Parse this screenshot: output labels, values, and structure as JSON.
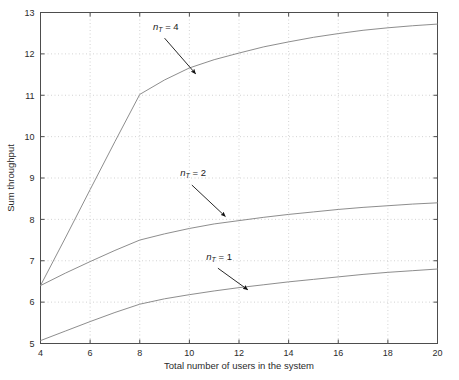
{
  "chart_data": {
    "type": "line",
    "title": "",
    "xlabel": "Total number of users in the system",
    "ylabel": "Sum throughput",
    "xlim": [
      4,
      20
    ],
    "ylim": [
      5,
      13
    ],
    "xticks": [
      4,
      6,
      8,
      10,
      12,
      14,
      16,
      18,
      20
    ],
    "yticks": [
      5,
      6,
      7,
      8,
      9,
      10,
      11,
      12,
      13
    ],
    "xtick_labels": [
      "4",
      "6",
      "8",
      "10",
      "12",
      "14",
      "16",
      "18",
      "20"
    ],
    "ytick_labels": [
      "5",
      "6",
      "7",
      "8",
      "9",
      "10",
      "11",
      "12",
      "13"
    ],
    "grid": true,
    "grid_style": "dotted",
    "grid_color": "#c8c8c8",
    "line_color": "#808080",
    "axis_color": "#4d4d4d",
    "legend": "annotations",
    "legend_position": "inline-arrows",
    "x": [
      4,
      5,
      6,
      7,
      8,
      9,
      10,
      11,
      12,
      13,
      14,
      15,
      16,
      17,
      18,
      19,
      20
    ],
    "series": [
      {
        "name": "nT = 4",
        "label_text": "n",
        "label_sub": "T",
        "label_eq": " = 4",
        "values": [
          6.4,
          7.55,
          8.72,
          9.88,
          11.02,
          11.37,
          11.66,
          11.86,
          12.02,
          12.17,
          12.29,
          12.4,
          12.49,
          12.57,
          12.63,
          12.68,
          12.72
        ],
        "annotation": {
          "text_x": 9.05,
          "text_y": 12.58,
          "arrow_from_x": 9.0,
          "arrow_from_y": 12.38,
          "arrow_to_x": 10.25,
          "arrow_to_y": 11.52
        }
      },
      {
        "name": "nT = 2",
        "label_text": "n",
        "label_sub": "T",
        "label_eq": " = 2",
        "values": [
          6.4,
          6.7,
          6.98,
          7.25,
          7.5,
          7.65,
          7.78,
          7.89,
          7.97,
          8.05,
          8.12,
          8.18,
          8.24,
          8.29,
          8.33,
          8.37,
          8.4
        ],
        "annotation": {
          "text_x": 10.15,
          "text_y": 9.05,
          "arrow_from_x": 10.1,
          "arrow_from_y": 8.83,
          "arrow_to_x": 11.45,
          "arrow_to_y": 8.07
        }
      },
      {
        "name": "nT = 1",
        "label_text": "n",
        "label_sub": "T",
        "label_eq": " = 1",
        "values": [
          5.07,
          5.3,
          5.53,
          5.75,
          5.95,
          6.08,
          6.18,
          6.27,
          6.35,
          6.42,
          6.49,
          6.55,
          6.61,
          6.67,
          6.72,
          6.76,
          6.8
        ],
        "annotation": {
          "text_x": 11.2,
          "text_y": 7.03,
          "arrow_from_x": 11.15,
          "arrow_from_y": 6.82,
          "arrow_to_x": 12.35,
          "arrow_to_y": 6.3
        }
      }
    ]
  }
}
